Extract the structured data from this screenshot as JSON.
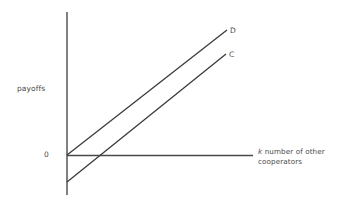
{
  "figure": {
    "background_color": "#ffffff",
    "axis_color": "#4a4a4a",
    "line_color": "#3a3a3a",
    "text_color": "#4a4a4a",
    "origin_label": "0",
    "ylabel": "payoffs",
    "xlabel_symbol": "k",
    "xlabel_text": " number of other cooperators",
    "xlabel_full": "k number of other cooperators",
    "curve_d_label": "D",
    "curve_c_label": "C"
  },
  "chart_data": {
    "type": "line",
    "title": "",
    "subtitle": "",
    "xlabel": "k number of other cooperators",
    "ylabel": "payoffs",
    "xlim": [
      0,
      1
    ],
    "ylim": [
      -0.22,
      1.0
    ],
    "grid": false,
    "legend": "inline-end-labels",
    "annotations": [
      {
        "name": "origin",
        "text": "0",
        "x": 0,
        "y": 0
      },
      {
        "name": "curve-d-end",
        "text": "D",
        "x": 1,
        "y": 1
      },
      {
        "name": "curve-c-end",
        "text": "C",
        "x": 1,
        "y": 0.81
      }
    ],
    "series": [
      {
        "name": "D",
        "label": "D",
        "description": "Defector payoff line, starts at origin",
        "x": [
          0,
          1
        ],
        "values": [
          0,
          1
        ],
        "pixel_points": [
          [
            67,
            155
          ],
          [
            227,
            30
          ]
        ]
      },
      {
        "name": "C",
        "label": "C",
        "description": "Cooperator payoff line, parallel but offset below origin",
        "x": [
          0,
          1
        ],
        "values": [
          -0.216,
          0.808
        ],
        "pixel_points": [
          [
            67,
            182
          ],
          [
            226,
            54
          ]
        ]
      }
    ],
    "axes": {
      "y_axis_pixel": [
        [
          67,
          12
        ],
        [
          67,
          195
        ]
      ],
      "x_axis_pixel": [
        [
          67,
          155
        ],
        [
          253,
          155
        ]
      ]
    }
  }
}
